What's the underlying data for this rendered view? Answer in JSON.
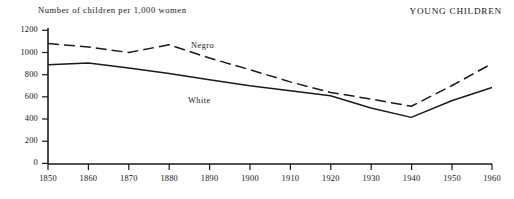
{
  "header": {
    "panel_title": "YOUNG CHILDREN",
    "axis_caption": "Number of children per 1,000 women"
  },
  "labels": {
    "negro": "Negro",
    "white": "White"
  },
  "chart_data": {
    "type": "line",
    "title": "YOUNG CHILDREN",
    "subtitle": "Number of children per 1,000 women",
    "xlabel": "",
    "ylabel": "Number of children per 1,000 women",
    "xlim": [
      1850,
      1960
    ],
    "ylim": [
      0,
      1200
    ],
    "xticks": [
      1850,
      1860,
      1870,
      1880,
      1890,
      1900,
      1910,
      1920,
      1930,
      1940,
      1950,
      1960
    ],
    "yticks": [
      0,
      200,
      400,
      600,
      800,
      1000,
      1200
    ],
    "grid": false,
    "legend": "inline-annotation",
    "x": [
      1850,
      1860,
      1870,
      1880,
      1890,
      1900,
      1910,
      1920,
      1930,
      1940,
      1950,
      1960
    ],
    "series": [
      {
        "name": "Negro",
        "style": "dashed",
        "color": "#1a1a1a",
        "values": [
          1080,
          1050,
          1000,
          1070,
          950,
          845,
          735,
          640,
          580,
          515,
          700,
          900
        ]
      },
      {
        "name": "White",
        "style": "solid",
        "color": "#1a1a1a",
        "values": [
          890,
          905,
          860,
          810,
          755,
          700,
          655,
          610,
          500,
          415,
          565,
          685
        ]
      }
    ]
  }
}
